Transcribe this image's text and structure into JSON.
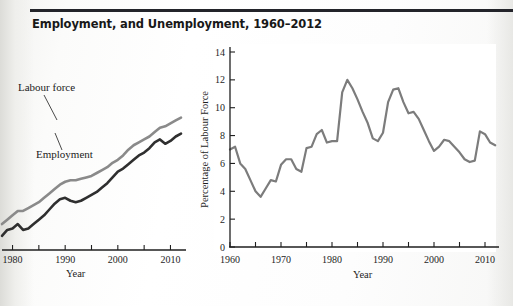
{
  "page": {
    "title": "Employment, and Unemployment, 1960–2012"
  },
  "left_panel": {
    "caption": "mployment",
    "axis_title_x": "Year",
    "annotations": {
      "labour_force": "Labour force",
      "employment": "Employment"
    },
    "x_tick_labels": [
      "1980",
      "1990",
      "2000",
      "2010"
    ]
  },
  "right_panel": {
    "caption": "(ii) Unemployment rate",
    "axis_title_x": "Year",
    "axis_title_y": "Percentage of Labour Force",
    "x_tick_labels": [
      "1960",
      "1970",
      "1980",
      "1990",
      "2000",
      "2010"
    ],
    "y_tick_labels": [
      "0",
      "2",
      "4",
      "6",
      "8",
      "10",
      "12",
      "14"
    ]
  },
  "colors": {
    "labour_force_line": "#8a8a8a",
    "employment_line": "#2f2f2f",
    "unemployment_line": "#7c7c7c",
    "axis": "#1f1f1f",
    "title_text": "#181818",
    "page_background": "#ffffff"
  },
  "chart_data": [
    {
      "id": "left-chart",
      "type": "line",
      "title": "",
      "xlabel": "Year",
      "ylabel": "",
      "xlim": [
        1978,
        2012
      ],
      "ylim": [
        0,
        20
      ],
      "grid": false,
      "legend": "inline-annotations",
      "x": [
        1978,
        1979,
        1980,
        1981,
        1982,
        1983,
        1984,
        1985,
        1986,
        1987,
        1988,
        1989,
        1990,
        1991,
        1992,
        1993,
        1994,
        1995,
        1996,
        1997,
        1998,
        1999,
        2000,
        2001,
        2002,
        2003,
        2004,
        2005,
        2006,
        2007,
        2008,
        2009,
        2010,
        2011,
        2012
      ],
      "series": [
        {
          "name": "Labour force",
          "values": [
            11.3,
            11.6,
            11.9,
            12.2,
            12.2,
            12.4,
            12.6,
            12.8,
            13.1,
            13.4,
            13.7,
            14.0,
            14.2,
            14.3,
            14.3,
            14.4,
            14.5,
            14.6,
            14.8,
            15.0,
            15.2,
            15.5,
            15.7,
            16.0,
            16.4,
            16.7,
            16.9,
            17.1,
            17.3,
            17.6,
            17.9,
            18.0,
            18.2,
            18.4,
            18.6
          ]
        },
        {
          "name": "Employment",
          "values": [
            10.5,
            10.9,
            11.0,
            11.3,
            10.9,
            11.0,
            11.3,
            11.6,
            11.9,
            12.3,
            12.7,
            13.0,
            13.1,
            12.9,
            12.8,
            12.9,
            13.1,
            13.3,
            13.5,
            13.8,
            14.1,
            14.5,
            14.9,
            15.1,
            15.4,
            15.7,
            16.0,
            16.2,
            16.5,
            16.9,
            17.1,
            16.8,
            17.0,
            17.3,
            17.5
          ]
        }
      ]
    },
    {
      "id": "right-chart",
      "type": "line",
      "title": "",
      "xlabel": "Year",
      "ylabel": "Percentage of Labour Force",
      "xlim": [
        1960,
        2012
      ],
      "ylim": [
        0,
        14
      ],
      "grid": false,
      "legend": "none",
      "x": [
        1960,
        1961,
        1962,
        1963,
        1964,
        1965,
        1966,
        1967,
        1968,
        1969,
        1970,
        1971,
        1972,
        1973,
        1974,
        1975,
        1976,
        1977,
        1978,
        1979,
        1980,
        1981,
        1982,
        1983,
        1984,
        1985,
        1986,
        1987,
        1988,
        1989,
        1990,
        1991,
        1992,
        1993,
        1994,
        1995,
        1996,
        1997,
        1998,
        1999,
        2000,
        2001,
        2002,
        2003,
        2004,
        2005,
        2006,
        2007,
        2008,
        2009,
        2010,
        2011,
        2012
      ],
      "series": [
        {
          "name": "Unemployment rate",
          "values": [
            7.0,
            7.2,
            6.0,
            5.6,
            4.8,
            4.0,
            3.6,
            4.2,
            4.8,
            4.7,
            5.9,
            6.3,
            6.3,
            5.6,
            5.4,
            7.1,
            7.2,
            8.1,
            8.4,
            7.5,
            7.6,
            7.6,
            11.1,
            12.0,
            11.4,
            10.6,
            9.7,
            8.9,
            7.8,
            7.6,
            8.2,
            10.4,
            11.3,
            11.4,
            10.4,
            9.6,
            9.7,
            9.2,
            8.4,
            7.6,
            6.9,
            7.2,
            7.7,
            7.6,
            7.2,
            6.8,
            6.3,
            6.1,
            6.2,
            8.3,
            8.1,
            7.5,
            7.3
          ]
        }
      ]
    }
  ]
}
